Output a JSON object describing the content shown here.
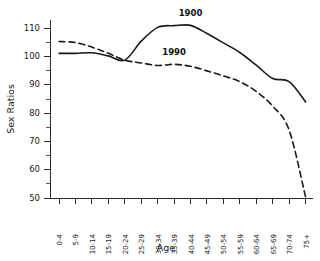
{
  "chart_data": {
    "type": "line",
    "title": "",
    "xlabel": "Age",
    "ylabel": "Sex Ratios",
    "ylim": [
      50,
      113
    ],
    "ytick_values": [
      50,
      60,
      70,
      80,
      90,
      100,
      110
    ],
    "ytick_labels": [
      "50",
      "60",
      "70",
      "80",
      "90",
      "100",
      "110"
    ],
    "yminor_step": 5,
    "grid": false,
    "legend_position": "inline-annotations",
    "categories": [
      "0-4",
      "5-9",
      "10-14",
      "15-19",
      "20-24",
      "25-29",
      "30-34",
      "35-39",
      "40-44",
      "45-49",
      "50-54",
      "55-59",
      "60-64",
      "65-69",
      "70-74",
      "75+"
    ],
    "series": [
      {
        "name": "1900",
        "style": "solid",
        "color": "#1a1a1a",
        "label_category": "40-44",
        "label_value": 114.5,
        "values": [
          101.2,
          101.2,
          101.4,
          100.3,
          98.8,
          105.5,
          110.4,
          111.0,
          111.1,
          108.2,
          104.9,
          101.5,
          97.0,
          92.3,
          91.2,
          84.0
        ]
      },
      {
        "name": "1990",
        "style": "dashed",
        "color": "#1a1a1a",
        "label_category": "35-39",
        "label_value": 100.5,
        "values": [
          105.4,
          105.0,
          103.4,
          101.2,
          98.8,
          97.8,
          96.9,
          97.3,
          96.6,
          95.0,
          93.2,
          91.2,
          87.7,
          82.5,
          74.0,
          50.3
        ]
      }
    ],
    "annotations": [
      {
        "text": "1900",
        "category": "40-44",
        "value": 114.5
      },
      {
        "text": "1990",
        "category": "35-39",
        "value": 100.5
      }
    ]
  },
  "axes": {
    "y_title": "Sex Ratios",
    "x_title": "Age"
  }
}
